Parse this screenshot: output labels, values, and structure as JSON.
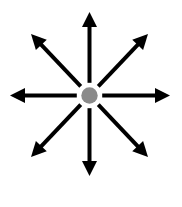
{
  "figure": {
    "type": "diagram",
    "canvas": {
      "width": 182,
      "height": 207,
      "background_color": "#ffffff"
    },
    "center": {
      "label": "center-node",
      "x": 89.5,
      "y": 95.5,
      "radius": 8.2,
      "fill_color": "#8a8a8a"
    },
    "style": {
      "arrow_color": "#000000",
      "shaft_width": 4,
      "arrowhead_length": 15,
      "arrowhead_width": 15,
      "hub_gap": 4.5
    },
    "arrow_count": 8,
    "arrows": [
      {
        "name": "arrow-up",
        "direction": "up",
        "angle_deg": 90,
        "tip": {
          "x": 89.5,
          "y": 12
        }
      },
      {
        "name": "arrow-up-right",
        "direction": "up-right",
        "angle_deg": 45,
        "tip": {
          "x": 148,
          "y": 34
        }
      },
      {
        "name": "arrow-right",
        "direction": "right",
        "angle_deg": 0,
        "tip": {
          "x": 170,
          "y": 95.5
        }
      },
      {
        "name": "arrow-down-right",
        "direction": "down-right",
        "angle_deg": -45,
        "tip": {
          "x": 148,
          "y": 157
        }
      },
      {
        "name": "arrow-down",
        "direction": "down",
        "angle_deg": -90,
        "tip": {
          "x": 89.5,
          "y": 176
        }
      },
      {
        "name": "arrow-down-left",
        "direction": "down-left",
        "angle_deg": -135,
        "tip": {
          "x": 31,
          "y": 157
        }
      },
      {
        "name": "arrow-left",
        "direction": "left",
        "angle_deg": 180,
        "tip": {
          "x": 10,
          "y": 95.5
        }
      },
      {
        "name": "arrow-up-left",
        "direction": "up-left",
        "angle_deg": 135,
        "tip": {
          "x": 31,
          "y": 34
        }
      }
    ]
  }
}
